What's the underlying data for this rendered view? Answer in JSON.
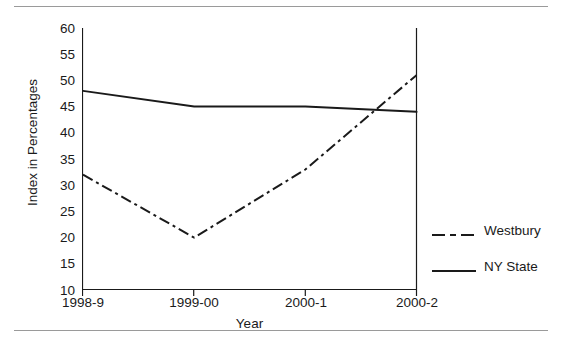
{
  "chart_data": {
    "type": "line",
    "title": "",
    "xlabel": "Year",
    "ylabel": "Index in Percentages",
    "categories": [
      "1998-9",
      "1999-00",
      "2000-1",
      "2000-2"
    ],
    "series": [
      {
        "name": "Westbury",
        "values": [
          32,
          20,
          33,
          51
        ],
        "style": "dash-dot",
        "color": "#1a1a1a"
      },
      {
        "name": "NY State",
        "values": [
          48,
          45,
          45,
          44
        ],
        "style": "solid",
        "color": "#1a1a1a"
      }
    ],
    "ylim": [
      10,
      60
    ],
    "yticks": [
      10,
      15,
      20,
      25,
      30,
      35,
      40,
      45,
      50,
      55,
      60
    ],
    "ytick_labels": [
      "10",
      "15",
      "20",
      "25",
      "30",
      "35",
      "40",
      "45",
      "50",
      "55",
      "60"
    ],
    "grid": false,
    "legend_position": "right",
    "axis_color": "#1a1a1a",
    "rule_color": "#9a9a9a",
    "background": "#ffffff"
  },
  "legend": {
    "items": [
      {
        "label": "Westbury"
      },
      {
        "label": "NY State"
      }
    ]
  }
}
